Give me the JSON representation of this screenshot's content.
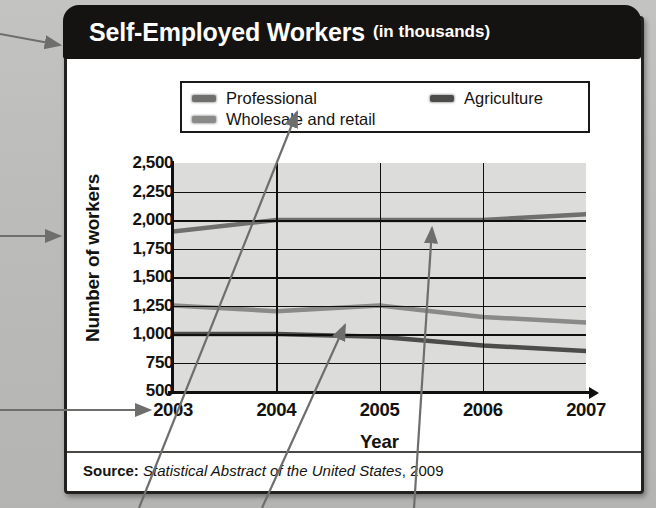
{
  "title": {
    "main": "Self-Employed Workers",
    "sub": "(in thousands)"
  },
  "source": {
    "label": "Source:",
    "work": "Statistical Abstract of the United States",
    "year": ", 2009"
  },
  "legend": {
    "professional": "Professional",
    "wholesale": "Wholesale and retail",
    "agriculture": "Agriculture"
  },
  "colors": {
    "banner": "#151311",
    "plot_background": "#dcdcda",
    "grid": "#100f0d",
    "professional": "#6f6f6d",
    "wholesale": "#8a8a88",
    "agriculture": "#4c4c4a",
    "callout_arrow": "#6e6e6c"
  },
  "chart_data": {
    "type": "line",
    "title": "Self-Employed Workers (in thousands)",
    "xlabel": "Year",
    "ylabel": "Number of workers",
    "x": [
      "2003",
      "2004",
      "2005",
      "2006",
      "2007"
    ],
    "categories": [
      "2003",
      "2004",
      "2005",
      "2006",
      "2007"
    ],
    "ylim": [
      500,
      2500
    ],
    "yticks": [
      "2,500",
      "2,250",
      "2,000",
      "1,750",
      "1,500",
      "1,250",
      "1,000",
      "750",
      "500"
    ],
    "ytick_values": [
      2500,
      2250,
      2000,
      1750,
      1500,
      1250,
      1000,
      750,
      500
    ],
    "grid": true,
    "legend_position": "top",
    "series": [
      {
        "name": "Professional",
        "values": [
          1900,
          2000,
          2000,
          2000,
          2050
        ]
      },
      {
        "name": "Wholesale and retail",
        "values": [
          1250,
          1200,
          1250,
          1150,
          1100
        ]
      },
      {
        "name": "Agriculture",
        "values": [
          1000,
          1000,
          975,
          900,
          850
        ]
      }
    ]
  }
}
